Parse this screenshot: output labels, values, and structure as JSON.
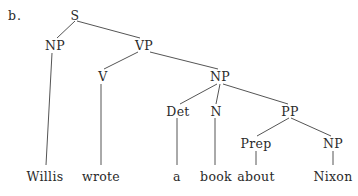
{
  "example_label": "b.",
  "line_color": "#555555",
  "nodes": {
    "S": {
      "label": "S",
      "x": 75,
      "y": 9
    },
    "NP1": {
      "label": "NP",
      "x": 55,
      "y": 39
    },
    "VP": {
      "label": "VP",
      "x": 144,
      "y": 39
    },
    "V": {
      "label": "V",
      "x": 103,
      "y": 70
    },
    "NP2": {
      "label": "NP",
      "x": 220,
      "y": 70
    },
    "Det": {
      "label": "Det",
      "x": 178,
      "y": 105
    },
    "N": {
      "label": "N",
      "x": 216,
      "y": 105
    },
    "PP": {
      "label": "PP",
      "x": 290,
      "y": 105
    },
    "Prep": {
      "label": "Prep",
      "x": 256,
      "y": 137
    },
    "NP3": {
      "label": "NP",
      "x": 333,
      "y": 137
    }
  },
  "words": {
    "w1": {
      "label": "Willis",
      "x": 45,
      "y": 170
    },
    "w2": {
      "label": "wrote",
      "x": 101,
      "y": 170
    },
    "w3": {
      "label": "a",
      "x": 177,
      "y": 170
    },
    "w4": {
      "label": "book",
      "x": 216,
      "y": 170
    },
    "w5": {
      "label": "about",
      "x": 256,
      "y": 170
    },
    "w6": {
      "label": "Nixon",
      "x": 333,
      "y": 170
    }
  }
}
